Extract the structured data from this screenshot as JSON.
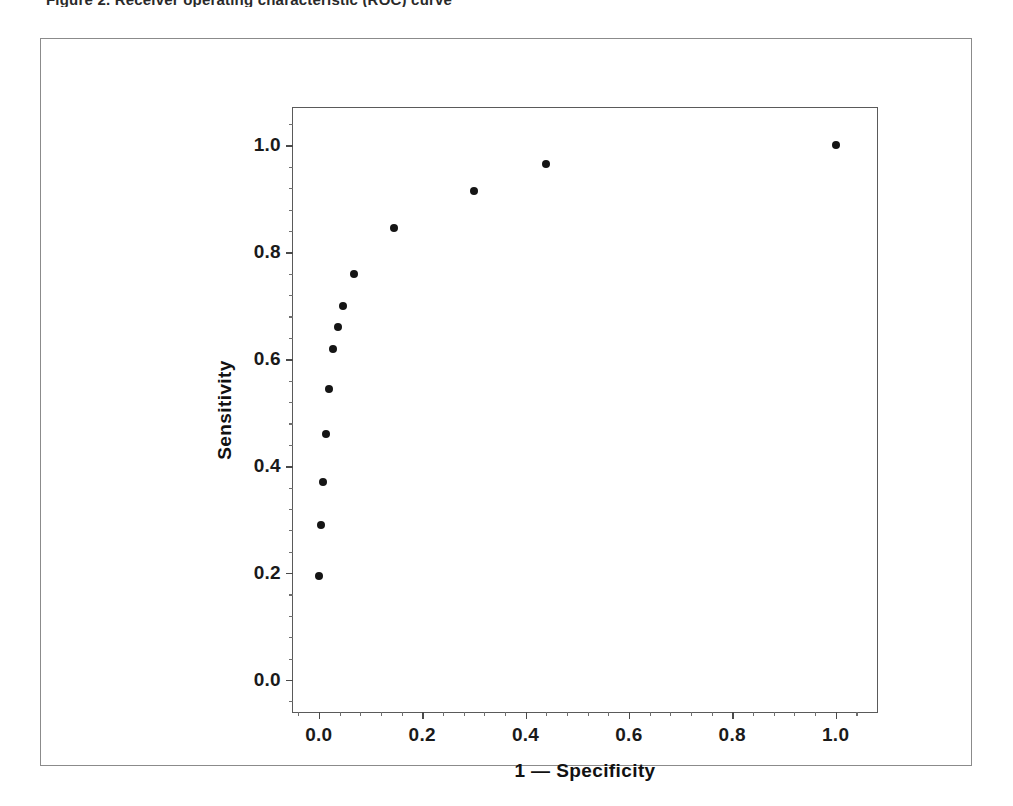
{
  "figure": {
    "top_clipped_text": "Figure 2. Receiver operating characteristic (ROC) curve",
    "background_color": "#ffffff",
    "frame_color": "#8b8b8b",
    "point_color": "#151515"
  },
  "chart_data": {
    "type": "scatter",
    "title": "",
    "xlabel": "1 — Specificity",
    "ylabel": "Sensitivity",
    "xlim": [
      -0.05,
      1.08
    ],
    "ylim": [
      -0.06,
      1.07
    ],
    "grid": false,
    "legend": null,
    "xticks": [
      0.0,
      0.2,
      0.4,
      0.6,
      0.8,
      1.0
    ],
    "xtick_labels": [
      "0.0",
      "0.2",
      "0.4",
      "0.6",
      "0.8",
      "1.0"
    ],
    "yticks": [
      0.0,
      0.2,
      0.4,
      0.6,
      0.8,
      1.0
    ],
    "ytick_labels": [
      "0.0",
      "0.2",
      "0.4",
      "0.6",
      "0.8",
      "1.0"
    ],
    "x_minor_interval": 0.04,
    "y_minor_interval": 0.04,
    "marker": "filled-circle",
    "marker_size_px": 8,
    "series": [
      {
        "name": "ROC operating points",
        "color": "#151515",
        "points": [
          {
            "x": 0.0,
            "y": 0.195
          },
          {
            "x": 0.005,
            "y": 0.29
          },
          {
            "x": 0.008,
            "y": 0.37
          },
          {
            "x": 0.013,
            "y": 0.46
          },
          {
            "x": 0.019,
            "y": 0.545
          },
          {
            "x": 0.028,
            "y": 0.62
          },
          {
            "x": 0.038,
            "y": 0.66
          },
          {
            "x": 0.046,
            "y": 0.7
          },
          {
            "x": 0.068,
            "y": 0.76
          },
          {
            "x": 0.146,
            "y": 0.845
          },
          {
            "x": 0.3,
            "y": 0.915
          },
          {
            "x": 0.44,
            "y": 0.965
          },
          {
            "x": 1.0,
            "y": 1.0
          }
        ]
      }
    ]
  }
}
